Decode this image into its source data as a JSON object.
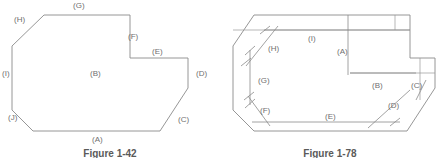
{
  "sheet": {
    "width": 440,
    "height": 158,
    "background": "#ffffff",
    "line_color": "#8a8a8a",
    "text_color": "#6f6f6f",
    "caption_color": "#5a5a5a"
  },
  "figures": [
    {
      "id": "figure-left",
      "caption": "Figure 1-42",
      "description": "Chamfered polygon outline with lettered surface callouts",
      "callouts": [
        {
          "label": "(G)",
          "x": 73,
          "y": 2
        },
        {
          "label": "(H)",
          "x": 14,
          "y": 16
        },
        {
          "label": "(F)",
          "x": 128,
          "y": 33
        },
        {
          "label": "(E)",
          "x": 152,
          "y": 48
        },
        {
          "label": "(D)",
          "x": 196,
          "y": 70
        },
        {
          "label": "(B)",
          "x": 90,
          "y": 70
        },
        {
          "label": "(I)",
          "x": 2,
          "y": 70
        },
        {
          "label": "(J)",
          "x": 8,
          "y": 114
        },
        {
          "label": "(C)",
          "x": 178,
          "y": 116
        },
        {
          "label": "(A)",
          "x": 92,
          "y": 136
        }
      ],
      "outline_points": "44,15 130,15 130,58 188,58 188,88 160,131 33,131 12,110 12,46"
    },
    {
      "id": "figure-right",
      "caption": "Figure 1-78",
      "description": "Same part outline with dimension lines and slash ticks",
      "callouts": [
        {
          "label": "(I)",
          "x": 88,
          "y": 35
        },
        {
          "label": "(H)",
          "x": 48,
          "y": 45
        },
        {
          "label": "(A)",
          "x": 117,
          "y": 48
        },
        {
          "label": "(G)",
          "x": 38,
          "y": 77
        },
        {
          "label": "(B)",
          "x": 152,
          "y": 82
        },
        {
          "label": "(C)",
          "x": 191,
          "y": 82
        },
        {
          "label": "(D)",
          "x": 168,
          "y": 102
        },
        {
          "label": "(F)",
          "x": 40,
          "y": 107
        },
        {
          "label": "(E)",
          "x": 105,
          "y": 113
        }
      ],
      "outline_points": "34,15 190,15 190,58 215,58 215,88 187,131 34,131 13,110 13,46"
    }
  ]
}
